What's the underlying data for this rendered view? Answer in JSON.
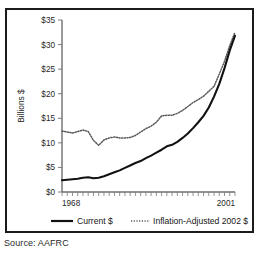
{
  "source": {
    "caption": "Source: AAFRC"
  },
  "chart_data": {
    "type": "line",
    "title": "",
    "xlabel": "",
    "ylabel": "Billions $",
    "xlim": [
      1968,
      2001
    ],
    "ylim": [
      0,
      35
    ],
    "grid": false,
    "legend_position": "bottom",
    "ytick_labels": [
      "$0",
      "$5",
      "$10",
      "$15",
      "$20",
      "$25",
      "$30",
      "$35"
    ],
    "ytick_values": [
      0,
      5,
      10,
      15,
      20,
      25,
      30,
      35
    ],
    "xtick_labels": [
      "1968",
      "2001"
    ],
    "xtick_values": [
      1968,
      2001
    ],
    "x": [
      1968,
      1969,
      1970,
      1971,
      1972,
      1973,
      1974,
      1975,
      1976,
      1977,
      1978,
      1979,
      1980,
      1981,
      1982,
      1983,
      1984,
      1985,
      1986,
      1987,
      1988,
      1989,
      1990,
      1991,
      1992,
      1993,
      1994,
      1995,
      1996,
      1997,
      1998,
      1999,
      2000,
      2001
    ],
    "series": [
      {
        "name": "Current $",
        "style": "solid",
        "color": "#111111",
        "values": [
          2.4,
          2.5,
          2.6,
          2.7,
          2.9,
          3.0,
          2.8,
          2.9,
          3.2,
          3.6,
          4.0,
          4.4,
          4.9,
          5.4,
          5.9,
          6.3,
          6.9,
          7.4,
          8.0,
          8.6,
          9.3,
          9.6,
          10.2,
          11.0,
          11.9,
          13.0,
          14.2,
          15.5,
          17.2,
          19.4,
          22.0,
          25.2,
          28.8,
          31.8
        ]
      },
      {
        "name": "Inflation-Adjusted 2002 $",
        "style": "dotted",
        "color": "#5a5a5a",
        "values": [
          12.4,
          12.2,
          12.0,
          12.3,
          12.6,
          12.3,
          10.5,
          9.5,
          10.6,
          11.0,
          11.2,
          11.0,
          11.0,
          11.1,
          11.5,
          12.2,
          12.9,
          13.4,
          14.2,
          15.5,
          15.6,
          15.6,
          16.0,
          16.6,
          17.4,
          18.2,
          18.8,
          19.5,
          20.5,
          21.5,
          24.0,
          26.6,
          29.8,
          32.5
        ]
      }
    ],
    "legend": [
      {
        "label": "Current $",
        "style": "solid"
      },
      {
        "label": "Inflation-Adjusted 2002 $",
        "style": "dotted"
      }
    ]
  }
}
